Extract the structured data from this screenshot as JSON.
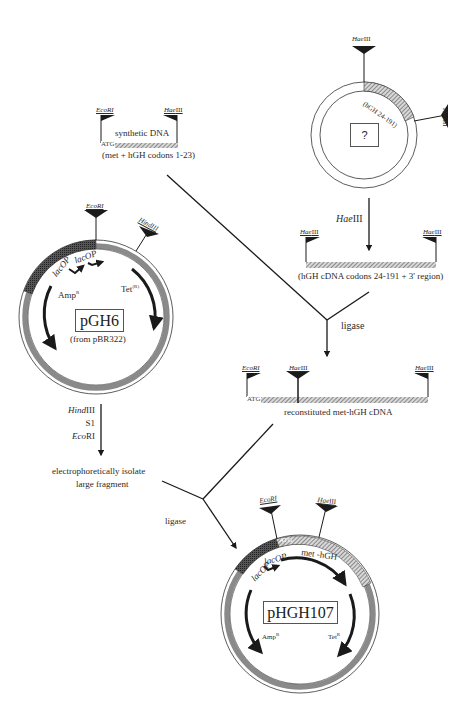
{
  "colors": {
    "line": "#1a1a1a",
    "ring": "#8a8a8a",
    "ring_dark": "#4a4a4a",
    "hatch": "#9a9a9a",
    "background": "#ffffff"
  },
  "unknown_plasmid": {
    "label": "?",
    "segment_label": "(hGH 24-191)",
    "sites": [
      "HaeIII",
      "HaeIII"
    ]
  },
  "synthetic_dna": {
    "label": "synthetic DNA",
    "start_codon": "ATG",
    "caption": "(met + hGH codons 1-23)",
    "left_site": "EcoRI",
    "right_site": "HaeIII"
  },
  "haeiii_step": {
    "enzyme_italic": "Hae",
    "enzyme_suffix": "III"
  },
  "hgh_cdna": {
    "left_site": "HaeIII",
    "right_site": "HaeIII",
    "caption": "(hGH cDNA codons 24-191 + 3' region)"
  },
  "ligase_1": {
    "label": "ligase"
  },
  "reconstituted": {
    "start_codon": "ATG",
    "caption": "reconstituted met-hGH cDNA",
    "sites": [
      "EcoRI",
      "HaeIII",
      "HaeIII"
    ]
  },
  "pGH6": {
    "name": "pGH6",
    "origin": "(from pBR322)",
    "sites": [
      "EcoRI",
      "HindIII"
    ],
    "promoters": [
      "lacOP",
      "lacOP"
    ],
    "genes": [
      {
        "name": "Amp",
        "sup": "R"
      },
      {
        "name": "Tet",
        "sup": "(R)"
      }
    ]
  },
  "digest_step": {
    "enzymes": [
      {
        "italic": "Hind",
        "suffix": "III"
      },
      {
        "italic": "",
        "suffix": "S1"
      },
      {
        "italic": "Eco",
        "suffix": "RI"
      }
    ],
    "result_line1": "electrophoretically isolate",
    "result_line2": "large fragment"
  },
  "ligase_2": {
    "label": "ligase"
  },
  "pHGH107": {
    "name": "pHGH107",
    "start_codon": "ATG",
    "gene_label": "met -hGH",
    "sites": [
      "EcoRI",
      "HaeIII"
    ],
    "promoters": [
      "lacOP",
      "lacOP"
    ],
    "genes": [
      {
        "name": "Amp",
        "sup": "R"
      },
      {
        "name": "Tet",
        "sup": "R"
      }
    ]
  }
}
